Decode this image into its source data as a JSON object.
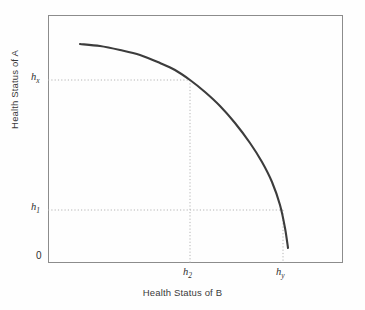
{
  "chart_data": {
    "type": "line",
    "title": "",
    "subtitle": "",
    "xlabel": "Health Status of B",
    "ylabel": "Health Status of A",
    "grid": false,
    "legend": null,
    "legend_position": "none",
    "xlim": [
      0,
      1
    ],
    "ylim": [
      0,
      1
    ],
    "axis": {
      "x_ticks": [
        {
          "label": "h2",
          "base": "h",
          "sub": "2",
          "x_px": 190
        },
        {
          "label": "hy",
          "base": "h",
          "sub": "y",
          "x_px": 283
        }
      ],
      "y_ticks": [
        {
          "label": "hx",
          "base": "h",
          "sub": "x",
          "y_px": 80
        },
        {
          "label": "h1",
          "base": "h",
          "sub": "1",
          "y_px": 210
        },
        {
          "label": "0",
          "base": "0",
          "sub": "",
          "y_px": 263
        }
      ]
    },
    "series": [
      {
        "name": "Health possibility frontier",
        "color": "#3c3c3c",
        "linewidth": 2.1,
        "points_px": [
          [
            80,
            44
          ],
          [
            100,
            46
          ],
          [
            120,
            50
          ],
          [
            140,
            55
          ],
          [
            160,
            63
          ],
          [
            175,
            70
          ],
          [
            190,
            80
          ],
          [
            205,
            92
          ],
          [
            220,
            106
          ],
          [
            235,
            123
          ],
          [
            250,
            143
          ],
          [
            262,
            162
          ],
          [
            272,
            182
          ],
          [
            280,
            205
          ],
          [
            285,
            228
          ],
          [
            288,
            248
          ]
        ]
      }
    ],
    "guides": [
      {
        "name": "hx-horizontal",
        "type": "horizontal",
        "from_px": [
          48,
          80
        ],
        "to_px": [
          190,
          80
        ]
      },
      {
        "name": "h2-vertical",
        "type": "vertical",
        "from_px": [
          190,
          80
        ],
        "to_px": [
          190,
          263
        ]
      },
      {
        "name": "h1-horizontal",
        "type": "horizontal",
        "from_px": [
          48,
          210
        ],
        "to_px": [
          283,
          210
        ]
      },
      {
        "name": "hy-vertical",
        "type": "vertical",
        "from_px": [
          283,
          210
        ],
        "to_px": [
          283,
          263
        ]
      }
    ],
    "colors": {
      "curve": "#3c3c3c",
      "frame": "#8c8c8c",
      "guide": "#b4b4b4",
      "text": "#2f2f2f",
      "background": "#fefefe"
    }
  }
}
